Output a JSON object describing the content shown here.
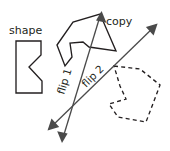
{
  "canvas": {
    "width": 170,
    "height": 151,
    "background": "#ffffff",
    "stroke_color": "#231f20",
    "axis_color": "#4a4a4a"
  },
  "labels": {
    "shape": "shape",
    "copy": "copy",
    "flip1": "flip 1",
    "flip2": "flip 2"
  },
  "shapes": {
    "original": {
      "name": "shape",
      "style": "solid",
      "points": "16,41 41,41 41,55 29,67 42,81 42,93 16,93"
    },
    "copy": {
      "name": "copy",
      "style": "solid",
      "points": "57,45 73,22 100,14 116,51 89,47 83,42 70,43 72,57 65,66"
    },
    "image": {
      "name": "dashed-image",
      "style": "dashed",
      "points": "114,66 140,69 160,85 146,122 118,117 109,104 126,99 120,86"
    }
  },
  "axes": [
    {
      "name": "flip-1-axis",
      "label": "flip 1",
      "x1": 62,
      "y1": 141,
      "x2": 101,
      "y2": 13,
      "arrow_start": true,
      "arrow_end": true,
      "label_x": 64,
      "label_y": 95,
      "label_rotation": -73
    },
    {
      "name": "flip-2-axis",
      "label": "flip 2",
      "x1": 49,
      "y1": 129,
      "x2": 156,
      "y2": 25,
      "arrow_start": true,
      "arrow_end": true,
      "label_x": 86,
      "label_y": 88,
      "label_rotation": -45
    }
  ],
  "text_labels": [
    {
      "name": "shape-label",
      "text": "shape",
      "x": 9,
      "y": 34
    },
    {
      "name": "copy-label",
      "text": "copy",
      "x": 106,
      "y": 25
    }
  ]
}
